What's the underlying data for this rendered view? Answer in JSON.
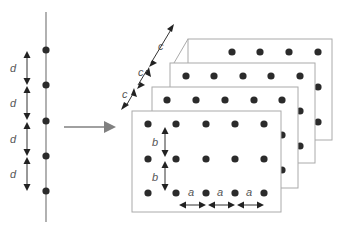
{
  "diagram": {
    "type": "lattice-construction",
    "colors": {
      "line": "#888888",
      "dot": "#2b2b2b",
      "arrow": "#222222",
      "transform_arrow": "#808080",
      "plane_border": "#aaaaaa",
      "label": "#555555"
    },
    "one_d_chain": {
      "label": "d",
      "spacing_labels": [
        "d",
        "d",
        "d",
        "d"
      ],
      "dot_count": 5
    },
    "transform_arrow": {
      "direction": "right"
    },
    "three_d_lattice": {
      "plane_count": 4,
      "plane_spacing_label": "c",
      "plane_spacing_labels": [
        "c",
        "c",
        "c"
      ],
      "row_spacing_label": "b",
      "row_spacing_labels": [
        "b",
        "b"
      ],
      "column_spacing_label": "a",
      "column_spacing_labels": [
        "a",
        "a",
        "a"
      ],
      "rows_per_plane": 3,
      "columns_per_plane": 5
    }
  }
}
